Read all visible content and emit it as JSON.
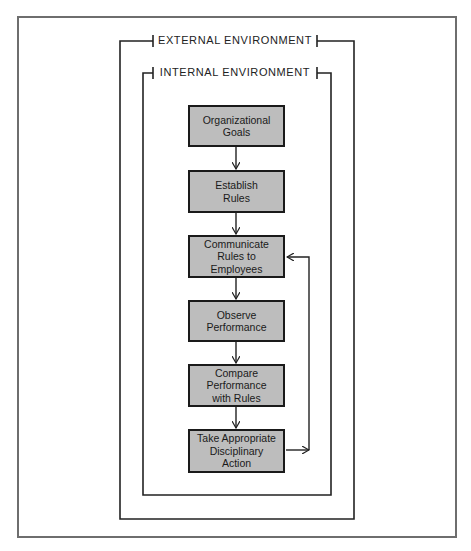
{
  "diagram": {
    "type": "flowchart",
    "outer_label": "EXTERNAL ENVIRONMENT",
    "inner_label": "INTERNAL ENVIRONMENT",
    "colors": {
      "box_fill": "#bdbdbd",
      "box_border": "#1a1a1a",
      "line": "#222222",
      "frame": "#6e6e6e"
    },
    "steps": [
      {
        "id": "goals",
        "label": "Organizational\nGoals"
      },
      {
        "id": "rules",
        "label": "Establish\nRules"
      },
      {
        "id": "communicate",
        "label": "Communicate\nRules to\nEmployees"
      },
      {
        "id": "observe",
        "label": "Observe\nPerformance"
      },
      {
        "id": "compare",
        "label": "Compare\nPerformance\nwith Rules"
      },
      {
        "id": "action",
        "label": "Take Appropriate\nDisciplinary\nAction"
      }
    ],
    "edges": [
      {
        "from": "goals",
        "to": "rules"
      },
      {
        "from": "rules",
        "to": "communicate"
      },
      {
        "from": "communicate",
        "to": "observe"
      },
      {
        "from": "observe",
        "to": "compare"
      },
      {
        "from": "compare",
        "to": "action"
      },
      {
        "from": "action",
        "to": "communicate",
        "kind": "feedback"
      }
    ]
  }
}
